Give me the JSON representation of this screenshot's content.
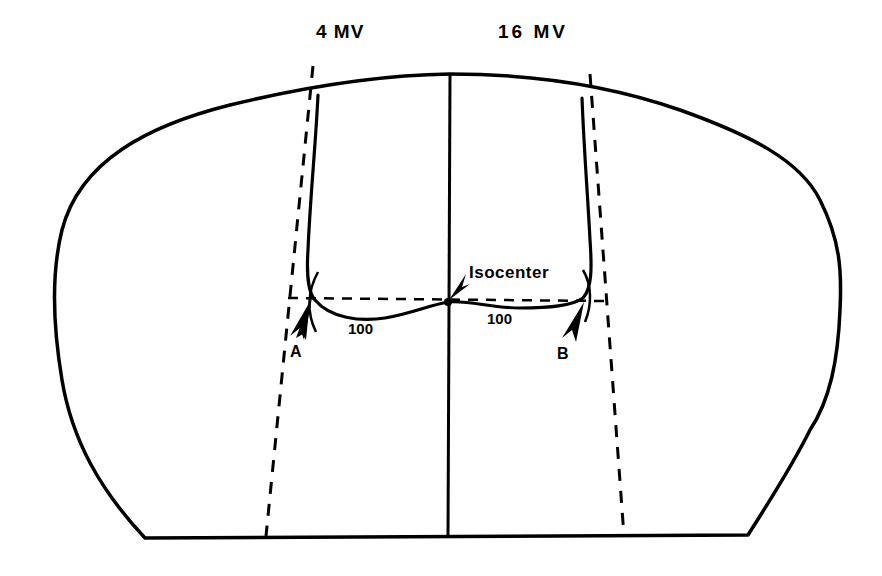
{
  "diagram": {
    "type": "radiotherapy opposed-beam isodose cross-section",
    "beams": [
      {
        "id": "left",
        "label": "4 MV"
      },
      {
        "id": "right",
        "label": "16 MV"
      }
    ],
    "isocenter_label": "Isocenter",
    "isodose_values": [
      {
        "side": "left",
        "value": "100"
      },
      {
        "side": "right",
        "value": "100"
      }
    ],
    "points": [
      {
        "id": "A",
        "label": "A"
      },
      {
        "id": "B",
        "label": "B"
      }
    ],
    "colors": {
      "line": "#000000",
      "background": "#ffffff"
    }
  }
}
